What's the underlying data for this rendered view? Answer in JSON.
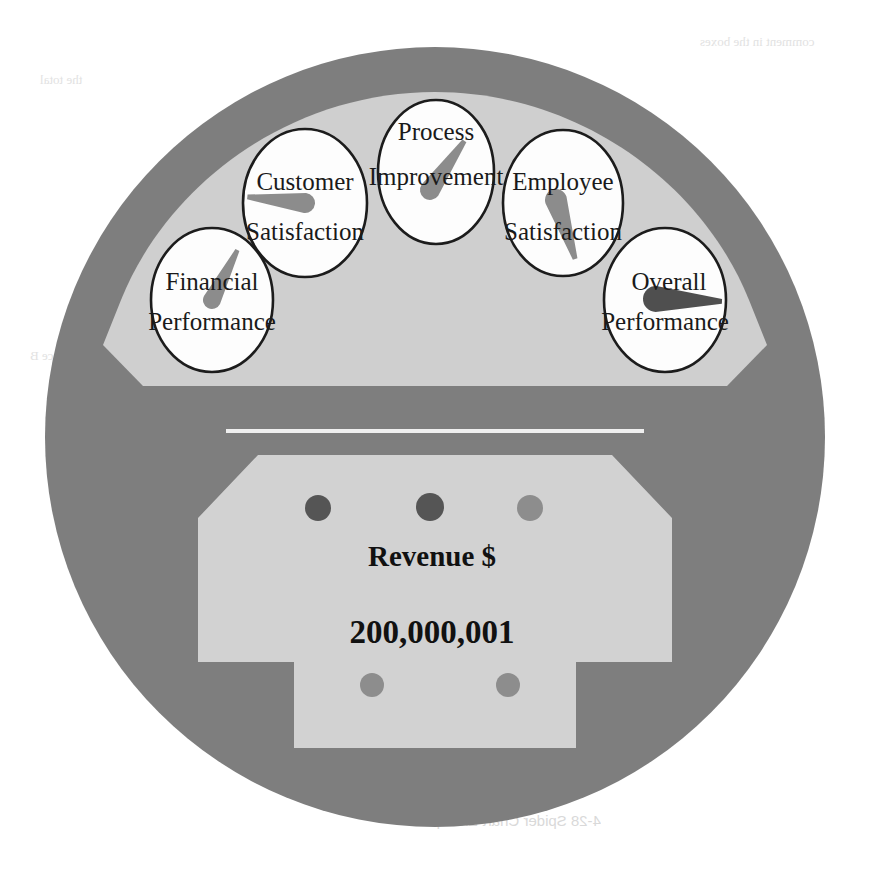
{
  "figure": {
    "kind": "dashboard-gauge-diagram",
    "title": "Spider Chart Example"
  },
  "colors": {
    "page_background": "#ffffff",
    "outer_rim": "#7e7e7e",
    "inner_panel": "#cfcfcf",
    "lower_panel": "#d2d2d2",
    "divider_line": "#efefef",
    "gauge_face": "#fdfdfd",
    "gauge_outline": "#1c1c1c",
    "needle_light": "#8c8c8c",
    "needle_dark": "#4f4f4f",
    "dot_dark": "#555555",
    "dot_mid": "#8d8d8d",
    "text": "#111111",
    "bleed_text": "#e0e0e0"
  },
  "gauges": [
    {
      "id": "financial-performance",
      "label_line1": "Financial",
      "label_line2": "Performance",
      "cx": 212,
      "cy": 300,
      "rx": 61,
      "ry": 72,
      "needle_angle_deg": -63,
      "needle_length": 58,
      "needle_shade": "light"
    },
    {
      "id": "customer-satisfaction",
      "label_line1": "Customer",
      "label_line2": "Satisfaction",
      "cx": 305,
      "cy": 203,
      "rx": 62,
      "ry": 74,
      "needle_angle_deg": -96,
      "needle_length": 60,
      "needle_shade": "light"
    },
    {
      "id": "process-improvement",
      "label_line1": "Process",
      "label_line2": "Improvement",
      "cx": 436,
      "cy": 172,
      "rx": 58,
      "ry": 72,
      "needle_angle_deg": -38,
      "needle_length": 60,
      "needle_shade": "light"
    },
    {
      "id": "employee-satisfaction",
      "label_line1": "Employee",
      "label_line2": "Satisfaction",
      "cx": 563,
      "cy": 203,
      "rx": 60,
      "ry": 73,
      "needle_angle_deg": 109,
      "needle_length": 62,
      "needle_shade": "light"
    },
    {
      "id": "overall-performance",
      "label_line1": "Overall",
      "label_line2": "Performance",
      "cx": 665,
      "cy": 300,
      "rx": 61,
      "ry": 72,
      "needle_angle_deg": 2,
      "needle_length": 62,
      "needle_shade": "dark"
    }
  ],
  "readout": {
    "title": "Revenue $",
    "value": "200,000,001"
  },
  "indicator_dots": [
    {
      "id": "dot-top-1",
      "cx": 318,
      "cy": 508,
      "r": 13,
      "shade": "dark"
    },
    {
      "id": "dot-top-2",
      "cx": 430,
      "cy": 507,
      "r": 14,
      "shade": "dark"
    },
    {
      "id": "dot-top-3",
      "cx": 530,
      "cy": 508,
      "r": 13,
      "shade": "mid"
    },
    {
      "id": "dot-bottom-1",
      "cx": 372,
      "cy": 685,
      "r": 12,
      "shade": "mid"
    },
    {
      "id": "dot-bottom-2",
      "cx": 508,
      "cy": 685,
      "r": 12,
      "shade": "mid"
    }
  ],
  "background_bleed": {
    "caption": "4-28   Spider Chart Example",
    "fragments": [
      "comment in the boxes",
      "the total",
      "reference B",
      "Mary Lee"
    ]
  }
}
